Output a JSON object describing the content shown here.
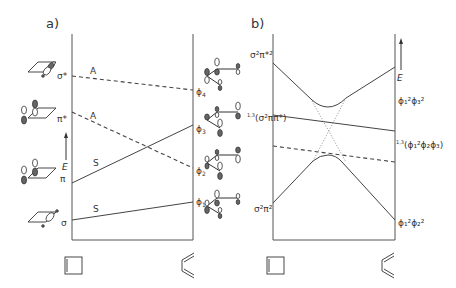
{
  "panel_a": {
    "label": "a)",
    "left_states": [
      {
        "label": "σ*",
        "symmetry": "A"
      },
      {
        "label": "π*",
        "symmetry": "A"
      },
      {
        "label": "π",
        "symmetry": "S"
      },
      {
        "label": "σ",
        "symmetry": "S"
      }
    ],
    "right_states": [
      {
        "label": "ϕ",
        "sub": "4"
      },
      {
        "label": "ϕ",
        "sub": "3"
      },
      {
        "label": "ϕ",
        "sub": "2"
      },
      {
        "label": "ϕ",
        "sub": "1"
      }
    ],
    "axis_label": "E",
    "bottom_left_molecule": "cyclobutene",
    "bottom_right_molecule": "butadiene"
  },
  "panel_b": {
    "label": "b)",
    "left_states": [
      {
        "label": "σ²π*²"
      },
      {
        "label": "σ²ππ*",
        "prefix": "1,3"
      },
      {
        "label": "σ²π²"
      }
    ],
    "right_states": [
      {
        "label": "ϕ₁²ϕ₃²"
      },
      {
        "label": "(ϕ₁²ϕ₂ϕ₃)",
        "prefix": "1,3"
      },
      {
        "label": "ϕ₁²ϕ₂²"
      }
    ],
    "axis_label": "E",
    "bottom_left_molecule": "cyclobutene",
    "bottom_right_molecule": "butadiene"
  },
  "text": {
    "a_label": "a)",
    "b_label": "b)",
    "sigma_star": "σ*",
    "pi_star": "π*",
    "pi": "π",
    "sigma": "σ",
    "A1": "A",
    "A2": "A",
    "S1": "S",
    "S2": "S",
    "E_a": "E",
    "E_b": "E",
    "phi": "ϕ",
    "sub4": "4",
    "sub3": "3",
    "sub2": "2",
    "sub1": "1",
    "b_top_left": "σ²π*²",
    "b_mid_left_prefix": "1,3",
    "b_mid_left": "(σ²ππ*)",
    "b_bot_left": "σ²π²",
    "b_top_right": "ϕ₁²ϕ₃²",
    "b_mid_right_prefix": "1,3",
    "b_mid_right": "(ϕ₁²ϕ₂ϕ₃)",
    "b_bot_right": "ϕ₁²ϕ₂²"
  }
}
